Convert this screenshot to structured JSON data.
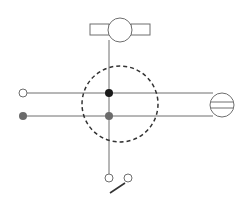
{
  "diagram": {
    "colors": {
      "line": "#6e6e6e",
      "stroke": "#4a4a4a",
      "dashed": "#333333",
      "live_dot": "#1a1a1a",
      "neutral_dot": "#6b6b6b",
      "open_terminal": "#ffffff"
    },
    "components": [
      {
        "id": "lamp",
        "label": "Lamp (ceiling light fixture)"
      },
      {
        "id": "junction-box",
        "label": "Junction box (dashed circle)"
      },
      {
        "id": "supply-live",
        "label": "Supply terminal (live, open)"
      },
      {
        "id": "supply-neutral",
        "label": "Supply terminal (neutral, filled)"
      },
      {
        "id": "socket",
        "label": "Socket outlet"
      },
      {
        "id": "switch",
        "label": "Single-pole switch"
      }
    ]
  }
}
